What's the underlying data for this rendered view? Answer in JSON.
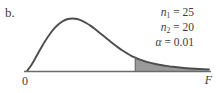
{
  "figure": {
    "part_label": "b.",
    "axis_origin_label": "0",
    "axis_x_label": "F",
    "annotation_n1_var": "n",
    "annotation_n1_sub": "1",
    "annotation_n1_eq": " = 25",
    "annotation_n2_var": "n",
    "annotation_n2_sub": "2",
    "annotation_n2_eq": " = 20",
    "annotation_alpha_var": "α",
    "annotation_alpha_eq": " = 0.01"
  },
  "colors": {
    "curve": "#4d4d4d",
    "shade_fill": "#9a9a9a",
    "axis": "#6b6b6b",
    "text": "#3b3b3b",
    "background": "#ffffff"
  },
  "chart_data": {
    "type": "area",
    "title": "",
    "subtitle": "",
    "xlabel": "F",
    "ylabel": "",
    "grid": false,
    "legend": null,
    "distribution": "F-distribution",
    "parameters": {
      "n1": 25,
      "n2": 20,
      "alpha": 0.01
    },
    "annotations": [
      "n1 = 25",
      "n2 = 20",
      "α = 0.01"
    ],
    "xlim": [
      0,
      1
    ],
    "ylim": [
      0,
      1
    ],
    "axis_tick_labels": [
      "0",
      "F"
    ],
    "critical_value_x": 0.595,
    "shaded_region": "right-tail",
    "shaded_area": 0.01,
    "x": [
      0.0,
      0.025,
      0.05,
      0.075,
      0.1,
      0.125,
      0.15,
      0.175,
      0.2,
      0.225,
      0.25,
      0.275,
      0.3,
      0.325,
      0.35,
      0.375,
      0.4,
      0.425,
      0.45,
      0.475,
      0.5,
      0.525,
      0.55,
      0.575,
      0.595,
      0.625,
      0.65,
      0.675,
      0.7,
      0.725,
      0.75,
      0.775,
      0.8,
      0.85,
      0.9,
      0.95,
      1.0
    ],
    "y": [
      0.0,
      0.12,
      0.27,
      0.425,
      0.57,
      0.7,
      0.81,
      0.895,
      0.955,
      0.99,
      1.0,
      0.99,
      0.96,
      0.915,
      0.86,
      0.795,
      0.725,
      0.655,
      0.585,
      0.515,
      0.45,
      0.39,
      0.335,
      0.285,
      0.255,
      0.21,
      0.182,
      0.158,
      0.138,
      0.12,
      0.105,
      0.092,
      0.08,
      0.062,
      0.048,
      0.038,
      0.03
    ]
  }
}
